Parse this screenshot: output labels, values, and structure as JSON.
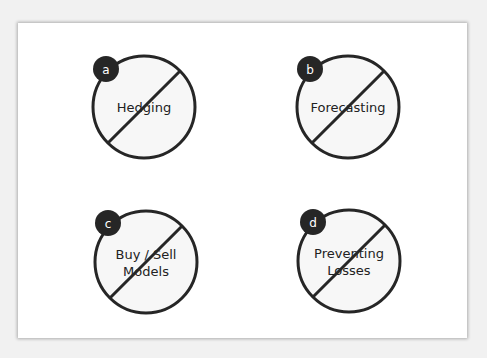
{
  "colors": {
    "page_background": "#f1f1f1",
    "card_background": "#ffffff",
    "circle_fill": "#f7f7f7",
    "stroke": "#262626",
    "badge_fill": "#262626",
    "badge_text": "#ffffff",
    "label_text": "#222222"
  },
  "items": [
    {
      "badge": "a",
      "label_lines": [
        "Hedging"
      ],
      "cx": 144,
      "cy": 107,
      "bx": 106,
      "by": 69
    },
    {
      "badge": "b",
      "label_lines": [
        "Forecasting"
      ],
      "cx": 348,
      "cy": 107,
      "bx": 310,
      "by": 69
    },
    {
      "badge": "c",
      "label_lines": [
        "Buy / Sell",
        "Models"
      ],
      "cx": 146,
      "cy": 262,
      "bx": 108,
      "by": 223
    },
    {
      "badge": "d",
      "label_lines": [
        "Preventing",
        "Losses"
      ],
      "cx": 349,
      "cy": 261,
      "bx": 313,
      "by": 222
    }
  ]
}
